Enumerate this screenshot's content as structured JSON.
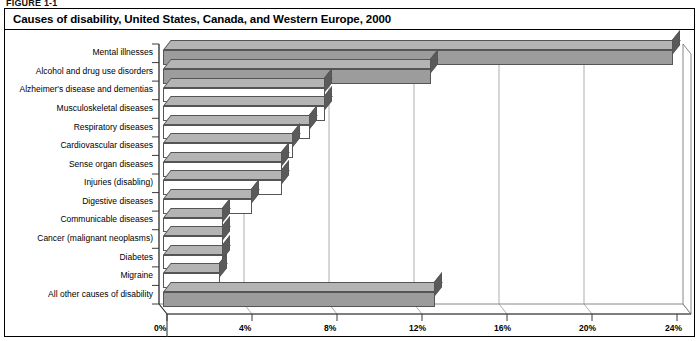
{
  "figure_caption": "FIGURE 1-1",
  "chart_title": "Causes of disability, United States, Canada, and Western Europe, 2000",
  "chart_data": {
    "type": "bar",
    "orientation": "horizontal",
    "title": "Causes of disability, United States, Canada, and Western Europe, 2000",
    "xlabel": "",
    "ylabel": "",
    "xlim": [
      0,
      24
    ],
    "xtick_labels": [
      "0%",
      "4%",
      "8%",
      "12%",
      "16%",
      "20%",
      "24%"
    ],
    "xticks": [
      0,
      4,
      8,
      12,
      16,
      20,
      24
    ],
    "grid": true,
    "legend": "none",
    "unit": "%",
    "categories": [
      "Mental illnesses",
      "Alcohol and drug use disorders",
      "Alzheimer's disease and dementias",
      "Musculoskeletal diseases",
      "Respiratory diseases",
      "Cardiovascular diseases",
      "Sense organ diseases",
      "Injuries (disabling)",
      "Digestive diseases",
      "Communicable diseases",
      "Cancer (malignant neoplasms)",
      "Diabetes",
      "Migraine",
      "All other causes of disability"
    ],
    "values": [
      24.0,
      12.6,
      7.6,
      7.6,
      6.9,
      6.1,
      5.6,
      5.6,
      4.2,
      2.8,
      2.8,
      2.8,
      2.7,
      12.8
    ],
    "bar_style": {
      "highlight_fill": "#9c9c9c",
      "default_fill": "#ffffff",
      "side_fill": "#5a5a5a",
      "top_fill": "#b4b4b4",
      "edge": "#555555",
      "highlighted_categories": [
        "Mental illnesses",
        "Alcohol and drug use disorders",
        "All other causes of disability"
      ]
    }
  },
  "xticks_render": [
    {
      "label": "0%",
      "x": 158
    },
    {
      "label": "4%",
      "x": 243
    },
    {
      "label": "8%",
      "x": 328
    },
    {
      "label": "12%",
      "x": 413
    },
    {
      "label": "16%",
      "x": 498
    },
    {
      "label": "20%",
      "x": 583
    },
    {
      "label": "24%",
      "x": 669
    }
  ]
}
